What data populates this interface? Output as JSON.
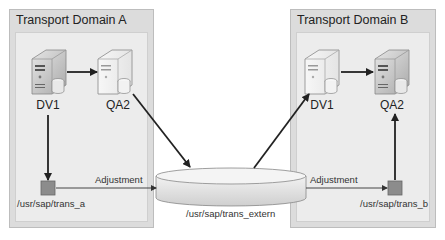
{
  "domains": [
    {
      "title": "Transport Domain A",
      "systems": [
        {
          "name": "DV1",
          "style": "dark"
        },
        {
          "name": "QA2",
          "style": "light"
        }
      ],
      "transport_dir": "/usr/sap/trans_a"
    },
    {
      "title": "Transport Domain B",
      "systems": [
        {
          "name": "DV1",
          "style": "light"
        },
        {
          "name": "QA2",
          "style": "dark"
        }
      ],
      "transport_dir": "/usr/sap/trans_b"
    }
  ],
  "shared_storage": {
    "label": "/usr/sap/trans_extern"
  },
  "edges": {
    "left_adjustment": "Adjustment",
    "right_adjustment": "Adjustment"
  },
  "colors": {
    "domain_outer": "#dcdcdc",
    "domain_inner": "#ececec",
    "transport_dir_box": "#8c8c8c",
    "arrow": "#222222"
  }
}
